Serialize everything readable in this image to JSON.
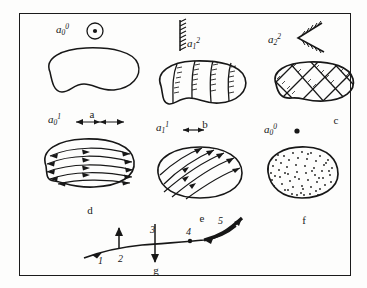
{
  "figure": {
    "border_color": "#1b1b1b",
    "ink_color": "#171717",
    "background": "#fdfdfc"
  },
  "panels": [
    {
      "id": "a",
      "caption": "a",
      "symbol": {
        "base": "a",
        "sub": "0",
        "sup": "0"
      },
      "marker": "circle-with-center-dot",
      "body": "plain-blob-outline",
      "description": "undeformed body, point symbol"
    },
    {
      "id": "b",
      "caption": "b",
      "symbol": {
        "base": "a",
        "sub": "1",
        "sup": "2"
      },
      "marker": "hatched-vertical-line",
      "body": "transverse-banded-blob",
      "description": "body with transverse hatched bands"
    },
    {
      "id": "c",
      "caption": "c",
      "symbol": {
        "base": "a",
        "sub": "2",
        "sup": "2"
      },
      "marker": "hatched-converging-wedge",
      "body": "cross-hatched-lattice-blob",
      "description": "body with cross-hatched diamond lattice"
    },
    {
      "id": "d",
      "caption": "d",
      "symbol": {
        "base": "a",
        "sub": "0",
        "sup": "1"
      },
      "marker": "double-headed-arrow-diverging",
      "body": "horizontal-flow-lines-bidirectional",
      "description": "body with bidirectional horizontal flow lines"
    },
    {
      "id": "e",
      "caption": "e",
      "symbol": {
        "base": "a",
        "sub": "1",
        "sup": "1"
      },
      "marker": "short-double-arrow",
      "body": "diagonal-flow-lines-unidirectional",
      "description": "body with diagonal flow lines"
    },
    {
      "id": "f",
      "caption": "f",
      "symbol": {
        "base": "a",
        "sub": "0",
        "sup": "0"
      },
      "marker": "solid-dot",
      "body": "stippled-blob",
      "description": "body with dense stipple fill"
    }
  ],
  "profile": {
    "id": "g",
    "caption": "g",
    "markers": [
      {
        "label": "1",
        "type": "inclined-arrow-on-curve"
      },
      {
        "label": "2",
        "type": "upward-arrow-tick"
      },
      {
        "label": "3",
        "type": "crossing-tick-both-sides"
      },
      {
        "label": "4",
        "type": "point-dot-on-curve"
      },
      {
        "label": "5",
        "type": "thickened-segment-with-arrowheads"
      }
    ]
  }
}
